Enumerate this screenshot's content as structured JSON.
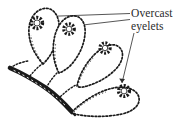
{
  "figure": {
    "type": "line-art-illustration",
    "background_color": "#ffffff",
    "ink_color": "#1a1a1a",
    "label": {
      "line_1": "Overcast",
      "line_2": "eyelets",
      "full_text": "Overcast eyelets",
      "text_color": "#2b2b2b"
    },
    "leader_lines": [
      {
        "name": "leader-to-petal-1-eyelet",
        "from": [
          130,
          14
        ],
        "to": [
          45,
          17
        ],
        "style": "straight",
        "arrow": false
      },
      {
        "name": "leader-to-petal-2-eyelet",
        "from": [
          130,
          20
        ],
        "to": [
          78,
          26
        ],
        "style": "straight",
        "arrow": false
      },
      {
        "name": "leader-to-petal-4-eyelet",
        "from": [
          133,
          33
        ],
        "to": [
          121,
          84
        ],
        "style": "straight",
        "arrow": true
      }
    ],
    "eyelets": [
      {
        "name": "eyelet-petal-1",
        "cx": 37,
        "cy": 23,
        "outer_r": 8.0,
        "inner_r": 3.2,
        "spokes": 16
      },
      {
        "name": "eyelet-petal-2",
        "cx": 69,
        "cy": 29,
        "outer_r": 7.6,
        "inner_r": 3.0,
        "spokes": 16
      },
      {
        "name": "eyelet-petal-3",
        "cx": 105,
        "cy": 48,
        "outer_r": 7.4,
        "inner_r": 2.9,
        "spokes": 16
      },
      {
        "name": "eyelet-petal-4",
        "cx": 124,
        "cy": 91,
        "outer_r": 7.8,
        "inner_r": 3.1,
        "spokes": 16
      }
    ],
    "petals": [
      {
        "name": "petal-1",
        "position": "upper-left",
        "orientation": "vertical"
      },
      {
        "name": "petal-2",
        "position": "upper-middle",
        "orientation": "vertical"
      },
      {
        "name": "petal-3",
        "position": "middle-right",
        "orientation": "diagonal"
      },
      {
        "name": "petal-4",
        "position": "lower-right",
        "orientation": "horizontal"
      }
    ],
    "stem": {
      "name": "stitched-stem",
      "description": "thick couched stem running from upper-left down to lower-right",
      "from": [
        10,
        68
      ],
      "to": [
        72,
        113
      ]
    },
    "stitch_style": "beaded outline with overcast eyelet centers"
  }
}
